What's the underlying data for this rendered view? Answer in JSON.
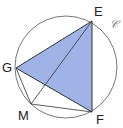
{
  "diagram": {
    "circle_label": "𝒞",
    "points": {
      "E": {
        "label": "E",
        "x": 92,
        "y": 21
      },
      "F": {
        "label": "F",
        "x": 92,
        "y": 112
      },
      "G": {
        "label": "G",
        "x": 16,
        "y": 68
      },
      "M": {
        "label": "M",
        "x": 31,
        "y": 104
      }
    },
    "circle": {
      "cx": 66,
      "cy": 67,
      "r": 51
    },
    "fill_color": "#9fb3e6",
    "stroke_color": "#333333",
    "shaded": "triangle EFG",
    "segments": [
      "EG",
      "GF",
      "EF",
      "EM",
      "GM",
      "MF"
    ]
  }
}
